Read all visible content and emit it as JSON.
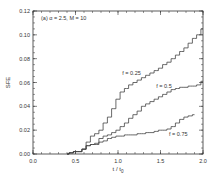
{
  "chart_data": {
    "type": "line",
    "title": "",
    "panel_label": "(a) α = 2.5, M = 10",
    "xlabel": "t / t",
    "xlabel_sub": "0",
    "ylabel": "SFE",
    "xlim": [
      0.0,
      2.0
    ],
    "ylim": [
      0.0,
      0.12
    ],
    "xticks": [
      0.0,
      0.5,
      1.0,
      1.5,
      2.0
    ],
    "xtick_labels": [
      "0.0",
      "0.5",
      "1.0",
      "1.5",
      "2.0"
    ],
    "yticks": [
      0.0,
      0.02,
      0.04,
      0.06,
      0.08,
      0.1,
      0.12
    ],
    "ytick_labels": [
      "0.00",
      "0.02",
      "0.04",
      "0.06",
      "0.08",
      "0.10",
      "0.12"
    ],
    "grid": false,
    "legend": "inline annotations",
    "series": [
      {
        "name": "f = 0.25",
        "label_pos": [
          1.05,
          0.066
        ],
        "x": [
          0.4,
          0.45,
          0.5,
          0.55,
          0.6,
          0.65,
          0.7,
          0.75,
          0.8,
          0.85,
          0.9,
          0.95,
          1.0,
          1.05,
          1.1,
          1.15,
          1.2,
          1.25,
          1.3,
          1.35,
          1.4,
          1.45,
          1.5,
          1.55,
          1.6,
          1.65,
          1.7,
          1.75,
          1.8,
          1.85,
          1.9,
          1.95,
          2.0
        ],
        "y": [
          0.0,
          0.001,
          0.002,
          0.002,
          0.004,
          0.01,
          0.015,
          0.017,
          0.02,
          0.026,
          0.031,
          0.038,
          0.046,
          0.052,
          0.055,
          0.058,
          0.06,
          0.062,
          0.064,
          0.066,
          0.068,
          0.07,
          0.072,
          0.075,
          0.077,
          0.08,
          0.083,
          0.086,
          0.089,
          0.093,
          0.097,
          0.1,
          0.105
        ]
      },
      {
        "name": "f = 0.5",
        "label_pos": [
          1.45,
          0.055
        ],
        "x": [
          0.4,
          0.45,
          0.5,
          0.55,
          0.6,
          0.65,
          0.7,
          0.75,
          0.8,
          0.85,
          0.9,
          0.95,
          1.0,
          1.05,
          1.1,
          1.15,
          1.2,
          1.25,
          1.3,
          1.35,
          1.4,
          1.45,
          1.5,
          1.55,
          1.6,
          1.65,
          1.7,
          1.75,
          1.8,
          1.85,
          1.9,
          1.95,
          2.0
        ],
        "y": [
          0.0,
          0.001,
          0.002,
          0.002,
          0.004,
          0.007,
          0.008,
          0.008,
          0.013,
          0.015,
          0.016,
          0.018,
          0.02,
          0.023,
          0.026,
          0.03,
          0.033,
          0.036,
          0.04,
          0.042,
          0.044,
          0.046,
          0.048,
          0.05,
          0.052,
          0.054,
          0.055,
          0.056,
          0.056,
          0.057,
          0.057,
          0.058,
          0.061
        ]
      },
      {
        "name": "f = 0.75",
        "label_pos": [
          1.6,
          0.015
        ],
        "x": [
          0.4,
          0.45,
          0.5,
          0.55,
          0.6,
          0.65,
          0.7,
          0.75,
          0.8,
          0.85,
          0.9,
          0.95,
          1.0,
          1.05,
          1.1,
          1.15,
          1.2,
          1.25,
          1.3,
          1.35,
          1.4,
          1.45,
          1.5,
          1.55,
          1.6,
          1.65,
          1.7,
          1.75,
          1.8,
          1.85,
          1.9
        ],
        "y": [
          0.0,
          0.001,
          0.002,
          0.002,
          0.004,
          0.007,
          0.008,
          0.009,
          0.01,
          0.011,
          0.013,
          0.014,
          0.015,
          0.015,
          0.016,
          0.016,
          0.016,
          0.017,
          0.017,
          0.018,
          0.018,
          0.019,
          0.02,
          0.02,
          0.021,
          0.023,
          0.026,
          0.029,
          0.031,
          0.032,
          0.033
        ]
      }
    ],
    "colors": {
      "axis": "#333333",
      "line": "#444444",
      "background": "#ffffff"
    }
  }
}
